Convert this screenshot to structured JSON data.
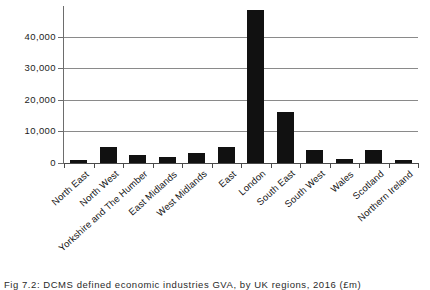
{
  "chart_data": {
    "type": "bar",
    "title": "",
    "xlabel": "",
    "ylabel": "",
    "categories": [
      "North East",
      "North West",
      "Yorkshire and The Humber",
      "East Midlands",
      "West Midlands",
      "East",
      "London",
      "South East",
      "South West",
      "Wales",
      "Scotland",
      "Northern Ireland"
    ],
    "values": [
      900,
      5000,
      2600,
      2000,
      3200,
      5100,
      48600,
      16200,
      4200,
      1200,
      4000,
      900
    ],
    "ylim": [
      0,
      48600
    ],
    "yticks": [
      0,
      10000,
      20000,
      30000,
      40000
    ],
    "ytick_labels": [
      "0",
      "10,000",
      "20,000",
      "30,000",
      "40,000"
    ],
    "grid": true,
    "legend": false,
    "bar_color": "#111111",
    "gridline_color": "#8a8a8a"
  },
  "caption": {
    "text": "Fig 7.2: DCMS defined economic industries GVA, by UK regions, 2016 (£m)"
  }
}
